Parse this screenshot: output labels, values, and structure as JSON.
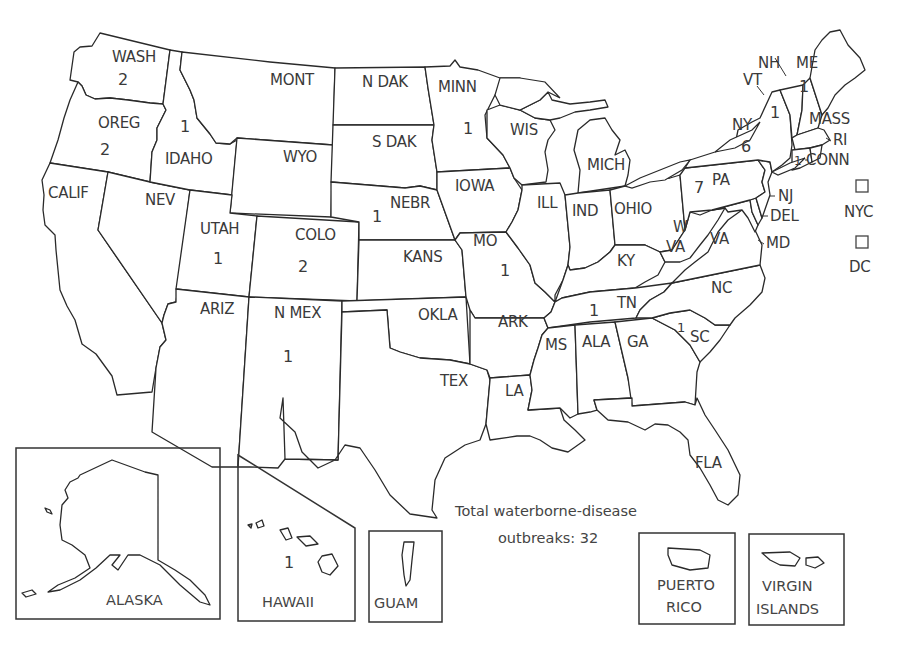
{
  "map": {
    "title": "Total waterborne-disease outbreaks, by state",
    "caption_line1": "Total waterborne-disease",
    "caption_line2": "outbreaks: 32",
    "total_outbreaks": 32,
    "states": [
      {
        "id": "wash",
        "label": "WASH",
        "count": "2"
      },
      {
        "id": "oreg",
        "label": "OREG",
        "count": "2"
      },
      {
        "id": "calif",
        "label": "CALIF",
        "count": ""
      },
      {
        "id": "idaho",
        "label": "IDAHO",
        "count": "1"
      },
      {
        "id": "nev",
        "label": "NEV",
        "count": ""
      },
      {
        "id": "mont",
        "label": "MONT",
        "count": ""
      },
      {
        "id": "wyo",
        "label": "WYO",
        "count": ""
      },
      {
        "id": "utah",
        "label": "UTAH",
        "count": "1"
      },
      {
        "id": "colo",
        "label": "COLO",
        "count": "2"
      },
      {
        "id": "ariz",
        "label": "ARIZ",
        "count": ""
      },
      {
        "id": "nmex",
        "label": "N MEX",
        "count": "1"
      },
      {
        "id": "ndak",
        "label": "N DAK",
        "count": ""
      },
      {
        "id": "sdak",
        "label": "S DAK",
        "count": ""
      },
      {
        "id": "nebr",
        "label": "NEBR",
        "count": "1"
      },
      {
        "id": "kans",
        "label": "KANS",
        "count": ""
      },
      {
        "id": "okla",
        "label": "OKLA",
        "count": ""
      },
      {
        "id": "tex",
        "label": "TEX",
        "count": ""
      },
      {
        "id": "minn",
        "label": "MINN",
        "count": "1"
      },
      {
        "id": "iowa",
        "label": "IOWA",
        "count": ""
      },
      {
        "id": "mo",
        "label": "MO",
        "count": "1"
      },
      {
        "id": "ark",
        "label": "ARK",
        "count": ""
      },
      {
        "id": "la",
        "label": "LA",
        "count": ""
      },
      {
        "id": "wis",
        "label": "WIS",
        "count": ""
      },
      {
        "id": "ill",
        "label": "ILL",
        "count": ""
      },
      {
        "id": "mich",
        "label": "MICH",
        "count": ""
      },
      {
        "id": "ind",
        "label": "IND",
        "count": ""
      },
      {
        "id": "ohio",
        "label": "OHIO",
        "count": ""
      },
      {
        "id": "ky",
        "label": "KY",
        "count": ""
      },
      {
        "id": "tn",
        "label": "TN",
        "count": "1"
      },
      {
        "id": "ms",
        "label": "MS",
        "count": ""
      },
      {
        "id": "ala",
        "label": "ALA",
        "count": ""
      },
      {
        "id": "ga",
        "label": "GA",
        "count": ""
      },
      {
        "id": "fla",
        "label": "FLA",
        "count": ""
      },
      {
        "id": "sc",
        "label": "SC",
        "count": "1"
      },
      {
        "id": "nc",
        "label": "NC",
        "count": ""
      },
      {
        "id": "va",
        "label": "VA",
        "count": ""
      },
      {
        "id": "wva_w",
        "label": "W",
        "count": ""
      },
      {
        "id": "wva_va",
        "label": "VA",
        "count": ""
      },
      {
        "id": "pa",
        "label": "PA",
        "count": "7"
      },
      {
        "id": "ny",
        "label": "NY",
        "count": "6"
      },
      {
        "id": "vt",
        "label": "VT",
        "count": "1"
      },
      {
        "id": "nh",
        "label": "NH",
        "count": ""
      },
      {
        "id": "me",
        "label": "ME",
        "count": "1"
      },
      {
        "id": "mass",
        "label": "MASS",
        "count": ""
      },
      {
        "id": "ri",
        "label": "RI",
        "count": ""
      },
      {
        "id": "conn",
        "label": "CONN",
        "count": "1"
      },
      {
        "id": "nj",
        "label": "NJ",
        "count": ""
      },
      {
        "id": "del",
        "label": "DEL",
        "count": ""
      },
      {
        "id": "md",
        "label": "MD",
        "count": ""
      }
    ],
    "cities": [
      {
        "id": "nyc",
        "label": "NYC",
        "count": ""
      },
      {
        "id": "dc",
        "label": "DC",
        "count": ""
      }
    ],
    "insets": [
      {
        "id": "alaska",
        "label": "ALASKA",
        "count": ""
      },
      {
        "id": "hawaii",
        "label": "HAWAII",
        "count": "1"
      },
      {
        "id": "guam",
        "label": "GUAM",
        "count": ""
      },
      {
        "id": "puerto_rico",
        "label_line1": "PUERTO",
        "label_line2": "RICO",
        "count": ""
      },
      {
        "id": "virgin_islands",
        "label_line1": "VIRGIN",
        "label_line2": "ISLANDS",
        "count": ""
      }
    ]
  }
}
